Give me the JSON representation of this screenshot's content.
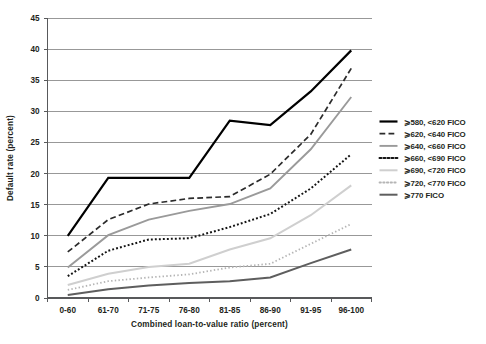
{
  "chart_data": {
    "type": "line",
    "title": "",
    "xlabel": "Combined loan-to-value ratio (percent)",
    "ylabel": "Default rate (percent)",
    "categories": [
      "0-60",
      "61-70",
      "71-75",
      "76-80",
      "81-85",
      "86-90",
      "91-95",
      "96-100"
    ],
    "ylim": [
      0,
      45
    ],
    "yticks": [
      0,
      5,
      10,
      15,
      20,
      25,
      30,
      35,
      40,
      45
    ],
    "grid": true,
    "legend_position": "right",
    "series": [
      {
        "name": "⩾580, <620 FICO",
        "style": "solid",
        "color": "#000000",
        "width": 2.2,
        "values": [
          10.0,
          19.3,
          19.3,
          19.3,
          28.5,
          27.8,
          33.2,
          39.8
        ]
      },
      {
        "name": "⩾620, <640 FICO",
        "style": "dashed",
        "color": "#2b2b2b",
        "width": 1.7,
        "values": [
          7.4,
          12.6,
          15.1,
          16.0,
          16.3,
          19.9,
          26.3,
          36.9
        ]
      },
      {
        "name": "⩾640, <660 FICO",
        "style": "solid",
        "color": "#9a9a9a",
        "width": 1.9,
        "values": [
          4.9,
          10.1,
          12.6,
          14.0,
          15.1,
          17.6,
          23.9,
          32.3
        ]
      },
      {
        "name": "⩾660, <690 FICO",
        "style": "dotted-thick",
        "color": "#141414",
        "width": 2.0,
        "values": [
          3.5,
          7.6,
          9.4,
          9.6,
          11.4,
          13.5,
          17.6,
          23.1
        ]
      },
      {
        "name": "⩾690, <720 FICO",
        "style": "solid",
        "color": "#cfcfcf",
        "width": 2.0,
        "values": [
          2.1,
          3.9,
          5.0,
          5.5,
          7.8,
          9.6,
          13.3,
          18.1
        ]
      },
      {
        "name": "⩾720, <770 FICO",
        "style": "dotted-fine",
        "color": "#b5b5b5",
        "width": 1.8,
        "values": [
          1.3,
          2.7,
          3.3,
          3.8,
          4.9,
          5.5,
          8.7,
          11.9
        ]
      },
      {
        "name": "⩾770 FICO",
        "style": "solid",
        "color": "#5e5e5e",
        "width": 2.0,
        "values": [
          0.5,
          1.4,
          2.0,
          2.4,
          2.7,
          3.3,
          5.6,
          7.8
        ]
      }
    ]
  }
}
